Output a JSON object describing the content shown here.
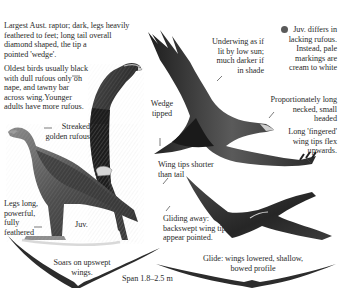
{
  "plate": {
    "labels": {
      "intro": "Largest Aust. raptor; dark, legs heavily\nfeathered to feet; long tail overall\ndiamond shaped, the tip a\npointed 'wedge'.",
      "oldest": "Oldest birds usually black\nwith dull rufous only on\nnape, and tawny bar\nacross wing.Younger\nadults have more rufous.",
      "underwing": "Underwing as if\nlit by low sun;\nmuch darker if\nin shade",
      "juv_note": "Juv. differs in\nlacking rufous.\nInstead, pale\nmarkings are\ncream to white",
      "wedge": "Wedge\ntipped",
      "neck": "Proportionately long\nnecked, small\nheaded",
      "fingered": "Long 'fingered'\nwing tips flex\nupwards.",
      "streaked": "Streaked\ngolden rufous",
      "wingtips": "Wing tips shorter\nthan tail",
      "legs": "Legs long,\npowerful,\nfully\nfeathered",
      "juv": "Juv.",
      "gliding": "Gliding away:\nbackswept wing tips\nappear pointed.",
      "soars": "Soars on upswept\nwings.",
      "glide": "Glide: wings lowered, shallow,\nbowed profile",
      "span": "Span 1.8–2.5 m"
    },
    "colors": {
      "ink": "#2b2b2b",
      "bird_dark": "#2e2e2e",
      "bird_mid": "#5c5c5c",
      "bird_light": "#9a9a9a",
      "juv_dot": "#5a5a5a"
    },
    "icons": {
      "juv_marker": "filled-circle"
    }
  }
}
